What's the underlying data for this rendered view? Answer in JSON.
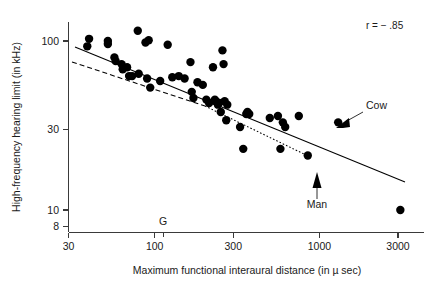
{
  "chart_data": {
    "type": "scatter",
    "title": "",
    "xlabel": "Maximum functional interaural distance (in µ sec)",
    "ylabel": "High-frequency hearing limit (in kHz)",
    "xscale": "log",
    "yscale": "log",
    "xlim": [
      30,
      3300
    ],
    "ylim": [
      8,
      130
    ],
    "grid": false,
    "legend": null,
    "xticks": [
      {
        "value": 30,
        "label": "30"
      },
      {
        "value": 100,
        "label": "100"
      },
      {
        "value": 300,
        "label": "300"
      },
      {
        "value": 1000,
        "label": "1000"
      },
      {
        "value": 3000,
        "label": "3000"
      }
    ],
    "yticks": [
      {
        "value": 100,
        "label": "100"
      },
      {
        "value": 30,
        "label": "30"
      },
      {
        "value": 10,
        "label": "10"
      },
      {
        "value": 8,
        "label": "8"
      }
    ],
    "annotations": [
      {
        "name": "correlation",
        "text": "r = − .85",
        "x_px": 366,
        "y_px": 29
      },
      {
        "name": "cow",
        "text": "Cow",
        "x_px": 366,
        "y_px": 106,
        "point": [
          1300,
          33
        ]
      },
      {
        "name": "man",
        "text": "Man",
        "x_px": 317,
        "y_px": 205,
        "point": [
          850,
          21
        ]
      },
      {
        "name": "g-marker",
        "text": "G",
        "x_px": 163,
        "y_px": 224
      }
    ],
    "series": [
      {
        "name": "mammal species",
        "marker": "filled-circle",
        "marker_size_px": 5.2,
        "color": "#000000",
        "points": [
          [
            40,
            103
          ],
          [
            39,
            93
          ],
          [
            52,
            100
          ],
          [
            52,
            96
          ],
          [
            57,
            80
          ],
          [
            58,
            76
          ],
          [
            63,
            73
          ],
          [
            64,
            68
          ],
          [
            68,
            70
          ],
          [
            70,
            62
          ],
          [
            73,
            62
          ],
          [
            79,
            115
          ],
          [
            80,
            64
          ],
          [
            88,
            98
          ],
          [
            92,
            101
          ],
          [
            90,
            60
          ],
          [
            94,
            53
          ],
          [
            108,
            58
          ],
          [
            120,
            95
          ],
          [
            128,
            61
          ],
          [
            140,
            62
          ],
          [
            152,
            60
          ],
          [
            165,
            75
          ],
          [
            168,
            50
          ],
          [
            172,
            46
          ],
          [
            182,
            57
          ],
          [
            196,
            55
          ],
          [
            206,
            45
          ],
          [
            214,
            43
          ],
          [
            226,
            70
          ],
          [
            232,
            45
          ],
          [
            235,
            44
          ],
          [
            242,
            42
          ],
          [
            246,
            43
          ],
          [
            252,
            38
          ],
          [
            258,
            88
          ],
          [
            262,
            73
          ],
          [
            266,
            44
          ],
          [
            272,
            34
          ],
          [
            276,
            42
          ],
          [
            330,
            31
          ],
          [
            345,
            23
          ],
          [
            360,
            37
          ],
          [
            366,
            38
          ],
          [
            375,
            37
          ],
          [
            500,
            35
          ],
          [
            560,
            36
          ],
          [
            580,
            23
          ],
          [
            600,
            33
          ],
          [
            620,
            31
          ],
          [
            750,
            36
          ],
          [
            850,
            21
          ],
          [
            1300,
            33
          ],
          [
            3100,
            10
          ]
        ]
      }
    ],
    "fit_lines": [
      {
        "name": "overall-regression",
        "style": "solid",
        "x_start_px": 75,
        "y_start_px": 47,
        "x_end_px": 405,
        "y_end_px": 182
      },
      {
        "name": "subset-dashed-fit",
        "style": "dashed",
        "x_start_px": 72,
        "y_start_px": 62,
        "x_end_px": 205,
        "y_end_px": 106
      },
      {
        "name": "subset-dotted-fit",
        "style": "dotted",
        "x_start_px": 205,
        "y_start_px": 106,
        "x_end_px": 306,
        "y_end_px": 155
      }
    ]
  },
  "axes": {
    "x_title": "Maximum functional interaural distance (in µ sec)",
    "y_title": "High-frequency hearing limit (in kHz)"
  }
}
